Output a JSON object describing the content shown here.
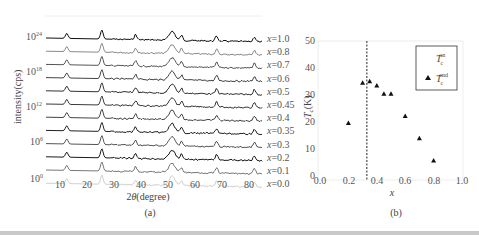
{
  "chart_data": [
    {
      "panel": "(a)",
      "type": "line",
      "title": "",
      "xlabel": "2θ(degree)",
      "ylabel": "intensity(cps)",
      "xlim": [
        0,
        85
      ],
      "x_ticks": [
        10,
        20,
        30,
        40,
        50,
        60,
        70,
        80
      ],
      "y_scale": "log",
      "y_ticks": [
        "10^0",
        "10^6",
        "10^12",
        "10^18",
        "10^24"
      ],
      "grid": false,
      "peak_positions_deg": [
        12.5,
        25.5,
        38,
        51.5,
        55,
        68,
        82
      ],
      "series": [
        {
          "name": "x=1.0",
          "shade": "#111111"
        },
        {
          "name": "x=0.8",
          "shade": "#8a8a8a"
        },
        {
          "name": "x=0.7",
          "shade": "#555555"
        },
        {
          "name": "x=0.6",
          "shade": "#444444"
        },
        {
          "name": "x=0.5",
          "shade": "#333333"
        },
        {
          "name": "x=0.45",
          "shade": "#3a3a3a"
        },
        {
          "name": "x=0.4",
          "shade": "#444444"
        },
        {
          "name": "x=0.35",
          "shade": "#222222"
        },
        {
          "name": "x=0.3",
          "shade": "#555555"
        },
        {
          "name": "x=0.2",
          "shade": "#1a1a1a"
        },
        {
          "name": "x=0.1",
          "shade": "#777777"
        },
        {
          "name": "x=0.0",
          "shade": "#d0d0d0"
        }
      ],
      "caption": "(a)"
    },
    {
      "panel": "(b)",
      "type": "scatter",
      "title": "",
      "xlabel": "x",
      "ylabel": "Tc(K)",
      "xlim": [
        0.0,
        1.0
      ],
      "ylim": [
        0,
        50
      ],
      "x_ticks": [
        "0.0",
        "0.2",
        "0.4",
        "0.6",
        "0.8",
        "1.0"
      ],
      "y_ticks": [
        "0",
        "10",
        "20",
        "30",
        "40",
        "50"
      ],
      "grid": false,
      "legend_position": "upper right",
      "legend": [
        {
          "label": "Tc^on",
          "marker": "none"
        },
        {
          "label": "Tc^end",
          "marker": "triangle"
        }
      ],
      "series": [
        {
          "name": "Tc^end",
          "marker": "triangle",
          "x": [
            0.2,
            0.3,
            0.35,
            0.4,
            0.45,
            0.5,
            0.6,
            0.7,
            0.8
          ],
          "y": [
            20.5,
            35,
            35.5,
            34,
            31,
            31,
            23,
            15,
            7
          ]
        }
      ],
      "annotations": [
        {
          "type": "vertical-dashed-line",
          "x": 0.33
        }
      ],
      "caption": "(b)"
    }
  ],
  "labels": {
    "a": {
      "xlabel_prefix": "2",
      "xlabel_theta": "θ",
      "xlabel_rest": "(degree)",
      "ylabel": "intensity(cps)",
      "caption": "(a)",
      "y_tick_base": "10",
      "y_tick_exps": [
        "0",
        "6",
        "12",
        "18",
        "24"
      ],
      "x_ticks": [
        "10",
        "20",
        "30",
        "40",
        "50",
        "60",
        "70",
        "80"
      ],
      "series_labels": [
        "x=1.0",
        "x=0.8",
        "x=0.7",
        "x=0.6",
        "x=0.5",
        "x=0.45",
        "x=0.4",
        "x=0.35",
        "x=0.3",
        "x=0.2",
        "x=0.1",
        "x=0.0"
      ]
    },
    "b": {
      "xlabel": "x",
      "ylabel_T": "T",
      "ylabel_sub": "c",
      "ylabel_unit": "(K)",
      "caption": "(b)",
      "x_ticks": [
        "0.0",
        "0.2",
        "0.4",
        "0.6",
        "0.8",
        "1.0"
      ],
      "y_ticks": [
        "0",
        "10",
        "20",
        "30",
        "40",
        "50"
      ],
      "legend_T": "T",
      "legend_sub": "c",
      "legend_on": "on",
      "legend_end": "end"
    }
  }
}
